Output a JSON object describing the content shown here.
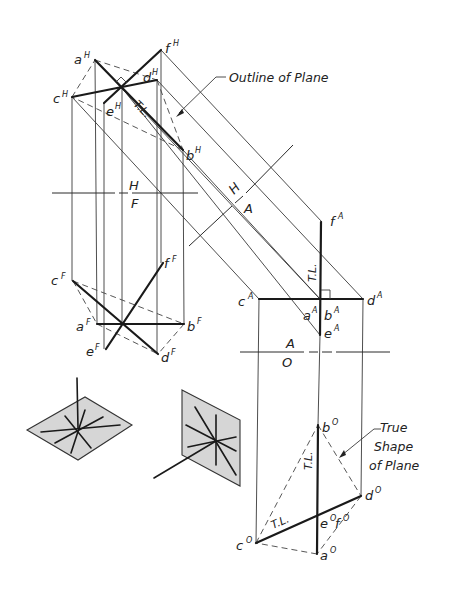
{
  "figure": {
    "views": {
      "top": {
        "name": "H",
        "points": [
          {
            "id": "a",
            "sup": "H",
            "label": "a"
          },
          {
            "id": "b",
            "sup": "H",
            "label": "b"
          },
          {
            "id": "c",
            "sup": "H",
            "label": "c"
          },
          {
            "id": "d",
            "sup": "H",
            "label": "d"
          },
          {
            "id": "e",
            "sup": "H",
            "label": "e"
          },
          {
            "id": "f",
            "sup": "H",
            "label": "f"
          }
        ],
        "tl_label": "T.L."
      },
      "front": {
        "name": "F",
        "points": [
          {
            "id": "a",
            "sup": "F",
            "label": "a"
          },
          {
            "id": "b",
            "sup": "F",
            "label": "b"
          },
          {
            "id": "c",
            "sup": "F",
            "label": "c"
          },
          {
            "id": "d",
            "sup": "F",
            "label": "d"
          },
          {
            "id": "e",
            "sup": "F",
            "label": "e"
          },
          {
            "id": "f",
            "sup": "F",
            "label": "f"
          }
        ]
      },
      "auxiliary": {
        "name": "A",
        "points": [
          {
            "id": "a",
            "sup": "A",
            "label": "a"
          },
          {
            "id": "b",
            "sup": "A",
            "label": "b"
          },
          {
            "id": "c",
            "sup": "A",
            "label": "c"
          },
          {
            "id": "d",
            "sup": "A",
            "label": "d"
          },
          {
            "id": "e",
            "sup": "A",
            "label": "e"
          },
          {
            "id": "f",
            "sup": "A",
            "label": "f"
          }
        ],
        "tl_label": "T.L."
      },
      "oblique": {
        "name": "O",
        "points": [
          {
            "id": "a",
            "sup": "O",
            "label": "a"
          },
          {
            "id": "b",
            "sup": "O",
            "label": "b"
          },
          {
            "id": "c",
            "sup": "O",
            "label": "c"
          },
          {
            "id": "d",
            "sup": "O",
            "label": "d"
          },
          {
            "id": "ef",
            "sup": "O",
            "label": "e",
            "label2": "f"
          }
        ],
        "tl_label_1": "T.L.",
        "tl_label_2": "T.L."
      }
    },
    "fold_lines": {
      "hf_top": "H",
      "hf_bottom": "F",
      "ha_top": "H",
      "ha_bottom": "A",
      "ao_top": "A",
      "ao_bottom": "O"
    },
    "annotations": {
      "outline": "Outline of Plane",
      "true_shape_1": "True",
      "true_shape_2": "Shape",
      "true_shape_3": "of Plane"
    }
  }
}
